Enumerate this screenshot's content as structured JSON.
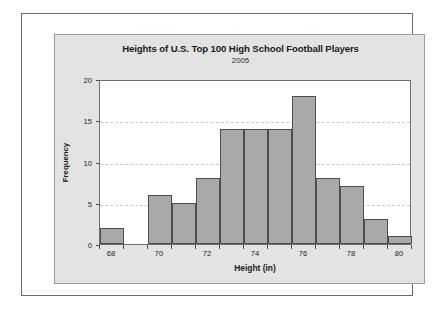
{
  "chart_data": {
    "type": "bar",
    "title": "Heights of U.S. Top 100 High School Football Players",
    "subtitle": "2005",
    "xlabel": "Height (in)",
    "ylabel": "Frequency",
    "categories": [
      68,
      69,
      70,
      71,
      72,
      73,
      74,
      75,
      76,
      77,
      78,
      79,
      80
    ],
    "values": [
      2,
      0,
      6,
      5,
      8,
      14,
      14,
      14,
      18,
      8,
      7,
      3,
      1
    ],
    "bin_width": 1,
    "xlim": [
      67.5,
      80.5
    ],
    "ylim": [
      0,
      20
    ],
    "x_ticks": [
      68,
      70,
      72,
      74,
      76,
      78,
      80
    ],
    "x_minor_ticks": [
      67.5,
      68.5,
      69.5,
      70.5,
      71.5,
      72.5,
      73.5,
      74.5,
      75.5,
      76.5,
      77.5,
      78.5,
      79.5,
      80.5
    ],
    "y_ticks": [
      0,
      5,
      10,
      15,
      20
    ],
    "grid": true,
    "grid_axis": "y",
    "legend": "none",
    "bar_color": "#a9a9a9",
    "bar_edge_color": "#4d4d4d",
    "panel_color": "#e3e3e3",
    "plot_background": "#ffffff",
    "total": 100
  }
}
